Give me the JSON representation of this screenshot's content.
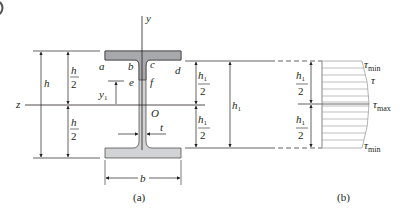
{
  "figure": {
    "type": "diagram",
    "colors": {
      "line": "#231f20",
      "flange_top_fill": "#a7a9ac",
      "web_shaded_fill": "#a7a9ac",
      "section_fill": "#d1d3d4",
      "diagram_fill": "#ffffff"
    }
  },
  "panel_a": {
    "caption": "(a)",
    "axes": {
      "y": "y",
      "z": "z",
      "origin": "O"
    },
    "points": {
      "a": "a",
      "b": "b",
      "c": "c",
      "d": "d",
      "e": "e",
      "f": "f"
    },
    "dimensions": {
      "h": "h",
      "h_half_num": "h",
      "h_half_den": "2",
      "y1_base": "y",
      "y1_sub": "1",
      "t": "t",
      "b": "b",
      "h1_half_num_base": "h",
      "h1_half_num_sub": "1",
      "h1_half_den": "2",
      "h1_base": "h",
      "h1_sub": "1"
    }
  },
  "panel_b": {
    "caption": "(b)",
    "labels": {
      "tau_min_top_base": "τ",
      "tau_min_top_sub": "min",
      "tau": "τ",
      "tau_max_base": "τ",
      "tau_max_sub": "max",
      "tau_min_bottom_base": "τ",
      "tau_min_bottom_sub": "min"
    },
    "dimensions": {
      "h1_half_num_base": "h",
      "h1_half_num_sub": "1",
      "h1_half_den": "2"
    }
  }
}
